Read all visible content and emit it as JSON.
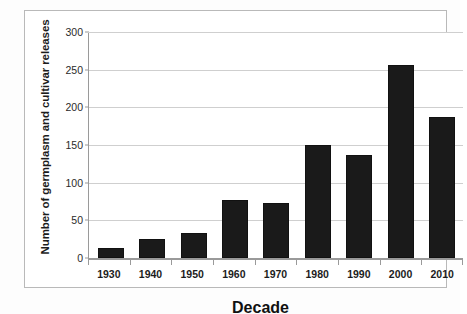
{
  "chart_data": {
    "type": "bar",
    "title": "",
    "xlabel": "Decade",
    "ylabel": "Number of germplasm and cultivar releases",
    "categories": [
      "1930",
      "1940",
      "1950",
      "1960",
      "1970",
      "1980",
      "1990",
      "2000",
      "2010"
    ],
    "values": [
      14,
      25,
      33,
      78,
      73,
      151,
      138,
      258,
      188
    ],
    "series": [
      {
        "name": "Germplasm and cultivar releases",
        "values": [
          14,
          25,
          33,
          78,
          73,
          151,
          138,
          258,
          188
        ]
      }
    ],
    "ylim": [
      0,
      300
    ],
    "yticks": [
      0,
      50,
      100,
      150,
      200,
      250,
      300
    ],
    "ytick_labels": [
      "0",
      "50",
      "100",
      "150",
      "200",
      "250",
      "300"
    ],
    "grid": true,
    "grid_axis": "y",
    "legend": false,
    "legend_position": "none",
    "bar_color": "#1a1a1a",
    "gridline_color": "#cfcfcf",
    "axis_color": "#9a9a9a",
    "plot_background": "#ffffff"
  }
}
